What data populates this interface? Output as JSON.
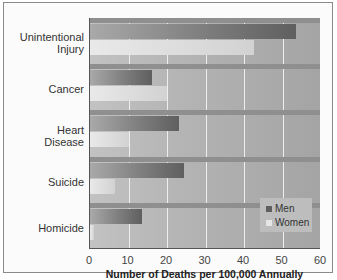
{
  "chart_data": {
    "type": "bar",
    "orientation": "horizontal",
    "title": "",
    "xlabel": "Number of Deaths per 100,000 Annually",
    "ylabel": "",
    "xlim": [
      0,
      60
    ],
    "x_ticks": [
      0,
      10,
      20,
      30,
      40,
      50,
      60
    ],
    "grid": "vertical",
    "legend_position": "lower right inside",
    "categories": [
      "Unintentional Injury",
      "Cancer",
      "Heart Disease",
      "Suicide",
      "Homicide"
    ],
    "category_lines": [
      [
        "Unintentional",
        "Injury"
      ],
      [
        "Cancer"
      ],
      [
        "Heart",
        "Disease"
      ],
      [
        "Suicide"
      ],
      [
        "Homicide"
      ]
    ],
    "series": [
      {
        "name": "Men",
        "color": "#6e6e6e",
        "values": [
          53.5,
          16,
          23,
          24.5,
          13.5
        ]
      },
      {
        "name": "Women",
        "color": "#e0e0e0",
        "values": [
          42.5,
          20,
          10,
          6.5,
          1
        ]
      }
    ]
  }
}
